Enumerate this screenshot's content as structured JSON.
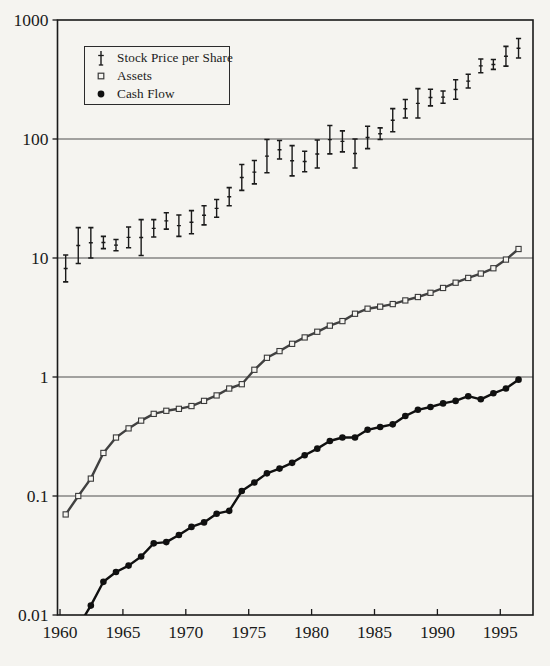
{
  "figure": {
    "background": "#f5f4f0",
    "ink": "#1a1a1a",
    "grid_color": "#4f4f4f"
  },
  "legend": {
    "position": "top-left-inside",
    "items": [
      {
        "label": "Stock Price per Share",
        "marker": "error-bar"
      },
      {
        "label": "Assets",
        "marker": "open-square"
      },
      {
        "label": "Cash Flow",
        "marker": "filled-circle"
      }
    ]
  },
  "chart_data": {
    "type": "line",
    "y_scale": "log",
    "grid": "horizontal-decade-lines",
    "xlim": [
      1959.8,
      1997.6
    ],
    "ylim": [
      0.01,
      1000
    ],
    "x_ticks": [
      1960,
      1965,
      1970,
      1975,
      1980,
      1985,
      1990,
      1995
    ],
    "y_ticks": [
      0.01,
      0.1,
      1,
      10,
      100,
      1000
    ],
    "title": "",
    "xlabel": "",
    "ylabel": "",
    "series": [
      {
        "name": "Stock Price per Share",
        "type": "range-bar",
        "marker": "error-bar",
        "color": "#1a1a1a",
        "years": [
          1960,
          1961,
          1962,
          1963,
          1964,
          1965,
          1966,
          1967,
          1968,
          1969,
          1970,
          1971,
          1972,
          1973,
          1974,
          1975,
          1976,
          1977,
          1978,
          1979,
          1980,
          1981,
          1982,
          1983,
          1984,
          1985,
          1986,
          1987,
          1988,
          1989,
          1990,
          1991,
          1992,
          1993,
          1994,
          1995,
          1996
        ],
        "low": [
          6.3,
          9.0,
          10.0,
          12.0,
          11.5,
          12.2,
          10.5,
          15.0,
          17.5,
          15.2,
          16.0,
          19.0,
          22.0,
          27.5,
          37.0,
          42.0,
          52.0,
          68.0,
          49.0,
          53.0,
          57.0,
          75.0,
          78.0,
          57.0,
          83.0,
          99.0,
          115.0,
          150.0,
          150.0,
          190.0,
          200.0,
          216.0,
          268.0,
          360.0,
          385.0,
          410.0,
          480.0
        ],
        "high": [
          10.6,
          18.0,
          18.0,
          15.2,
          14.3,
          18.2,
          21.0,
          21.0,
          24.0,
          23.0,
          25.0,
          27.5,
          31.0,
          39.0,
          61.0,
          66.0,
          99.0,
          97.0,
          88.0,
          79.0,
          98.0,
          130.0,
          117.0,
          100.0,
          128.0,
          124.0,
          180.0,
          215.0,
          265.0,
          262.0,
          253.0,
          315.0,
          350.0,
          470.0,
          465.0,
          600.0,
          700.0
        ]
      },
      {
        "name": "Assets",
        "type": "line",
        "marker": "open-square",
        "color": "#414141",
        "years": [
          1960,
          1961,
          1962,
          1963,
          1964,
          1965,
          1966,
          1967,
          1968,
          1969,
          1970,
          1971,
          1972,
          1973,
          1974,
          1975,
          1976,
          1977,
          1978,
          1979,
          1980,
          1981,
          1982,
          1983,
          1984,
          1985,
          1986,
          1987,
          1988,
          1989,
          1990,
          1991,
          1992,
          1993,
          1994,
          1995,
          1996
        ],
        "values": [
          0.07,
          0.1,
          0.14,
          0.23,
          0.31,
          0.37,
          0.43,
          0.49,
          0.52,
          0.54,
          0.57,
          0.63,
          0.7,
          0.8,
          0.87,
          1.15,
          1.45,
          1.65,
          1.9,
          2.15,
          2.4,
          2.7,
          2.95,
          3.4,
          3.75,
          3.9,
          4.1,
          4.4,
          4.7,
          5.1,
          5.6,
          6.2,
          6.8,
          7.4,
          8.2,
          9.7,
          11.9
        ]
      },
      {
        "name": "Cash Flow",
        "type": "line",
        "marker": "filled-circle",
        "color": "#101010",
        "years": [
          1961,
          1962,
          1963,
          1964,
          1965,
          1966,
          1967,
          1968,
          1969,
          1970,
          1971,
          1972,
          1973,
          1974,
          1975,
          1976,
          1977,
          1978,
          1979,
          1980,
          1981,
          1982,
          1983,
          1984,
          1985,
          1986,
          1987,
          1988,
          1989,
          1990,
          1991,
          1992,
          1993,
          1994,
          1995,
          1996
        ],
        "values": [
          0.008,
          0.012,
          0.019,
          0.023,
          0.026,
          0.031,
          0.04,
          0.041,
          0.047,
          0.055,
          0.06,
          0.071,
          0.075,
          0.11,
          0.13,
          0.155,
          0.17,
          0.19,
          0.22,
          0.25,
          0.29,
          0.31,
          0.31,
          0.36,
          0.38,
          0.4,
          0.47,
          0.53,
          0.56,
          0.6,
          0.63,
          0.69,
          0.65,
          0.73,
          0.8,
          0.95
        ]
      }
    ]
  }
}
